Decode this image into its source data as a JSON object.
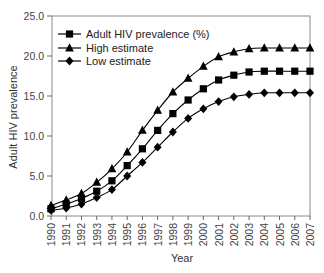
{
  "chart_data": {
    "type": "line",
    "title": "",
    "xlabel": "Year",
    "ylabel": "Adult HIV prevalence",
    "ylim": [
      0,
      25
    ],
    "yticks": [
      "0.0",
      "5.0",
      "10.0",
      "15.0",
      "20.0",
      "25.0"
    ],
    "grid": false,
    "legend_position": "upper-left",
    "categories": [
      "1990",
      "1991",
      "1992",
      "1993",
      "1994",
      "1995",
      "1996",
      "1997",
      "1998",
      "1999",
      "2000",
      "2001",
      "2002",
      "2003",
      "2004",
      "2005",
      "2006",
      "2007"
    ],
    "series": [
      {
        "name": "Adult HIV prevalence (%)",
        "marker": "square",
        "color": "#000000",
        "values": [
          0.9,
          1.5,
          2.2,
          3.1,
          4.4,
          6.3,
          8.4,
          10.7,
          12.8,
          14.5,
          15.9,
          17.0,
          17.6,
          18.0,
          18.1,
          18.1,
          18.1,
          18.1
        ]
      },
      {
        "name": "High estimate",
        "marker": "triangle",
        "color": "#000000",
        "values": [
          1.3,
          2.0,
          2.8,
          4.2,
          5.9,
          8.0,
          10.7,
          13.2,
          15.5,
          17.2,
          18.7,
          19.9,
          20.5,
          20.9,
          21.0,
          21.0,
          21.0,
          21.0
        ]
      },
      {
        "name": "Low estimate",
        "marker": "diamond",
        "color": "#000000",
        "values": [
          0.7,
          1.0,
          1.5,
          2.3,
          3.3,
          5.0,
          6.7,
          8.6,
          10.5,
          12.2,
          13.4,
          14.3,
          14.9,
          15.2,
          15.4,
          15.4,
          15.4,
          15.4
        ]
      }
    ]
  }
}
